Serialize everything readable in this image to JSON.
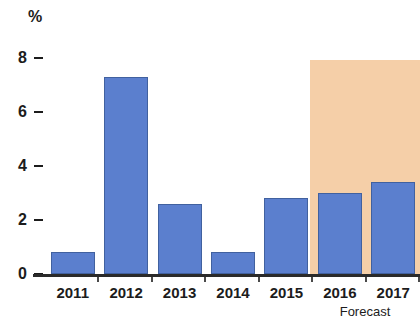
{
  "chart_data": {
    "type": "bar",
    "title": "",
    "subtitle": "",
    "xlabel": "",
    "ylabel": "%",
    "unit_label": "%",
    "categories": [
      "2011",
      "2012",
      "2013",
      "2014",
      "2015",
      "2016",
      "2017"
    ],
    "values": [
      0.8,
      7.3,
      2.6,
      0.8,
      2.8,
      3.0,
      3.4
    ],
    "series": [
      {
        "name": "",
        "values": [
          0.8,
          7.3,
          2.6,
          0.8,
          2.8,
          3.0,
          3.4
        ]
      }
    ],
    "ylim": [
      0,
      8
    ],
    "yticks": [
      0,
      2,
      4,
      6,
      8
    ],
    "ytick_labels": [
      "0",
      "2",
      "4",
      "6",
      "8"
    ],
    "grid": false,
    "legend": null,
    "bar_color": "#5b7fce",
    "bar_border_color": "#41619f",
    "axis_color": "#2a2a2a",
    "annotations": [
      {
        "name": "forecast-band",
        "label": "Forecast",
        "covers_categories": [
          "2016",
          "2017"
        ],
        "color": "#f5cfa8"
      }
    ]
  }
}
